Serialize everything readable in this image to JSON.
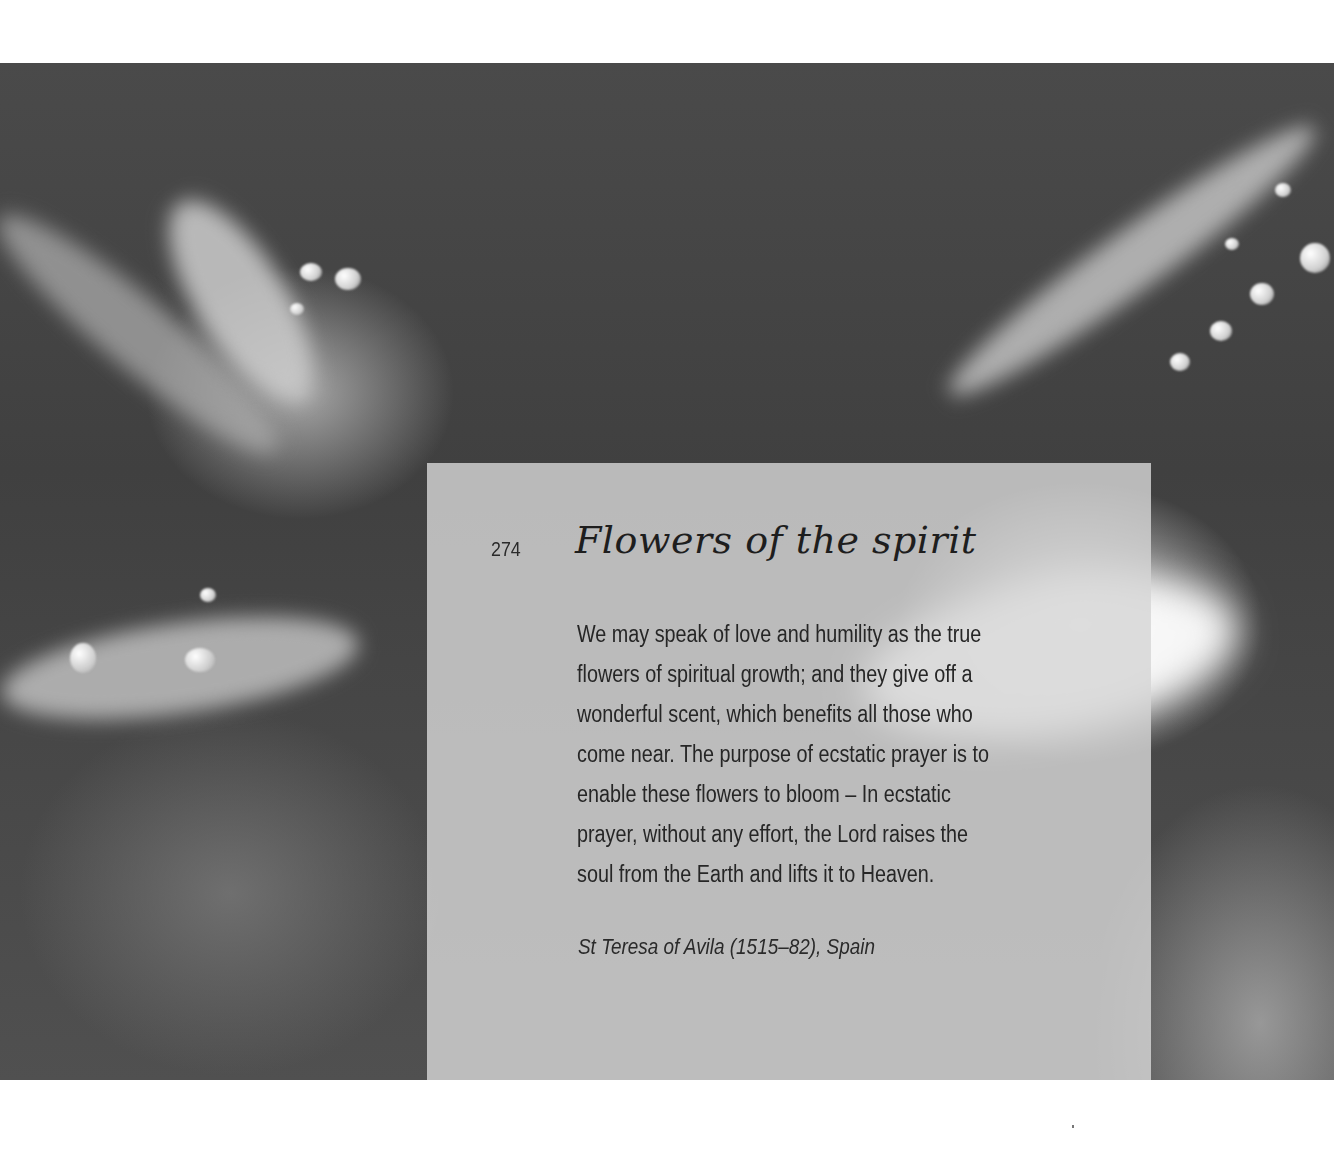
{
  "page": {
    "page_number": "274",
    "title": "Flowers of the spirit",
    "quote_lines": [
      "We may speak of love and humility as the true",
      "flowers of spiritual growth; and they give off a",
      "wonderful scent, which benefits all those who",
      "come near. The purpose of ecstatic prayer is to",
      "enable these flowers to bloom – In ecstatic",
      "prayer, without any effort, the Lord raises the",
      "soul from the Earth and lifts it to Heaven."
    ],
    "attribution": "St Teresa of Avila (1515–82), Spain"
  },
  "photo": {
    "subject": "close-up of dew-covered flower stems, black and white",
    "tone": "monochrome"
  },
  "colors": {
    "background": "#ffffff",
    "photo_dark": "#444444",
    "panel": "#d6d6d6",
    "text": "#262626"
  }
}
